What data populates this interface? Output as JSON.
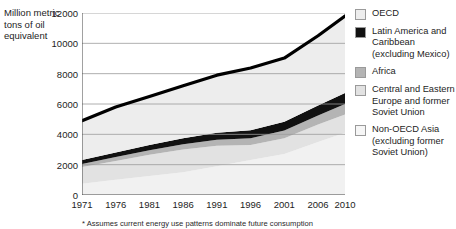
{
  "chart_data": {
    "type": "area",
    "title": "",
    "xlabel": "",
    "ylabel": "Million metric tons of oil equivalent",
    "ylim": [
      0,
      12000
    ],
    "xlim": [
      1971,
      2010
    ],
    "grid": true,
    "legend_position": "right",
    "yticks": [
      "0",
      "2000",
      "4000",
      "6000",
      "8000",
      "10000",
      "12000"
    ],
    "ytick_values": [
      0,
      2000,
      4000,
      6000,
      8000,
      10000,
      12000
    ],
    "xticks": [
      "1971",
      "1976",
      "1981",
      "1986",
      "1991",
      "1996",
      "2001",
      "2006",
      "2010"
    ],
    "xtick_values": [
      1971,
      1976,
      1981,
      1986,
      1991,
      1996,
      2001,
      2006,
      2010
    ],
    "x": [
      1971,
      1976,
      1981,
      1986,
      1991,
      1996,
      2001,
      2006,
      2010
    ],
    "stacked": true,
    "series": [
      {
        "name": "Non-OECD Asia (excluding former Soviet Union)",
        "color": "#f1f1f1",
        "values": [
          750,
          1000,
          1250,
          1500,
          1900,
          2300,
          2700,
          3500,
          4100
        ]
      },
      {
        "name": "Central and Eastern Europe and former Soviet Union",
        "color": "#e2e2e2",
        "values": [
          1100,
          1250,
          1400,
          1500,
          1350,
          1000,
          1050,
          1150,
          1200
        ]
      },
      {
        "name": "Africa",
        "color": "#b4b4b4",
        "values": [
          200,
          250,
          300,
          350,
          400,
          450,
          500,
          600,
          700
        ]
      },
      {
        "name": "Latin America and Caribbean (excluding Mexico)",
        "color": "#111111",
        "values": [
          250,
          300,
          350,
          400,
          450,
          520,
          580,
          650,
          720
        ]
      },
      {
        "name": "OECD",
        "color": "#ededed",
        "values": [
          2600,
          3000,
          3200,
          3450,
          3800,
          4100,
          4200,
          4600,
          5080
        ]
      }
    ],
    "total_line": {
      "name": "Total world energy consumption",
      "color": "#000000",
      "values": [
        4900,
        5800,
        6500,
        7200,
        7900,
        8370,
        9030,
        10500,
        11800
      ]
    },
    "annotations": [
      "* Assumes current energy use patterns dominate future consumption"
    ]
  },
  "axis": {
    "y_title": "Million metric tons of oil equivalent"
  },
  "legend": {
    "items": [
      {
        "label": "OECD",
        "color": "#ededed"
      },
      {
        "label": "Latin America and Caribbean (excluding Mexico)",
        "color": "#111111"
      },
      {
        "label": "Africa",
        "color": "#b4b4b4"
      },
      {
        "label": "Central and Eastern Europe and former Soviet Union",
        "color": "#e2e2e2"
      },
      {
        "label": "Non-OECD Asia (excluding former Soviet Union)",
        "color": "#f6f6f6"
      }
    ]
  },
  "footnote": "* Assumes current energy use patterns dominate future consumption"
}
